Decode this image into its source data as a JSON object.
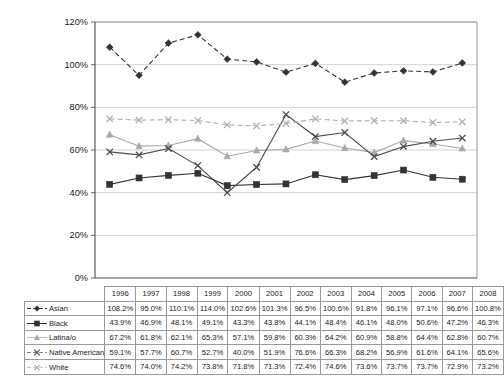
{
  "chart_data": {
    "type": "line",
    "title": "",
    "xlabel": "",
    "ylabel": "",
    "ylim": [
      0,
      120
    ],
    "ytick_labels": [
      "0%",
      "20%",
      "40%",
      "60%",
      "80%",
      "100%",
      "120%"
    ],
    "yticks": [
      0,
      20,
      40,
      60,
      80,
      100,
      120
    ],
    "grid": true,
    "legend_position": "table-left",
    "categories": [
      "1996",
      "1997",
      "1998",
      "1999",
      "2000",
      "2001",
      "2002",
      "2003",
      "2004",
      "2005",
      "2006",
      "2007",
      "2008"
    ],
    "series": [
      {
        "name": "Asian",
        "marker": "diamond",
        "line_style": "dashed",
        "color": "#333333",
        "values": [
          108.2,
          95.0,
          110.1,
          114.0,
          102.6,
          101.3,
          96.5,
          100.6,
          91.8,
          96.1,
          97.1,
          96.6,
          100.8
        ],
        "labels": [
          "108.2%",
          "95.0%",
          "110.1%",
          "114.0%",
          "102.6%",
          "101.3%",
          "96.5%",
          "100.6%",
          "91.8%",
          "96.1%",
          "97.1%",
          "96.6%",
          "100.8%"
        ]
      },
      {
        "name": "Black",
        "marker": "square",
        "line_style": "solid",
        "color": "#333333",
        "values": [
          43.9,
          46.9,
          48.1,
          49.1,
          43.3,
          43.8,
          44.1,
          48.4,
          46.1,
          48.0,
          50.6,
          47.2,
          46.3
        ],
        "labels": [
          "43.9%",
          "46.9%",
          "48.1%",
          "49.1%",
          "43.3%",
          "43.8%",
          "44.1%",
          "48.4%",
          "46.1%",
          "48.0%",
          "50.6%",
          "47.2%",
          "46.3%"
        ]
      },
      {
        "name": "Latina/o",
        "marker": "triangle",
        "line_style": "solid",
        "color": "#a9a9a9",
        "values": [
          67.2,
          61.8,
          62.1,
          65.3,
          57.1,
          59.8,
          60.3,
          64.2,
          60.9,
          58.8,
          64.4,
          62.8,
          60.7
        ],
        "labels": [
          "67.2%",
          "61.8%",
          "62.1%",
          "65.3%",
          "57.1%",
          "59.8%",
          "60.3%",
          "64.2%",
          "60.9%",
          "58.8%",
          "64.4%",
          "62.8%",
          "60.7%"
        ]
      },
      {
        "name": "Native American",
        "marker": "x-cross",
        "line_style": "solid",
        "color": "#4d4d4d",
        "values": [
          59.1,
          57.7,
          60.7,
          52.7,
          40.0,
          51.9,
          76.6,
          66.3,
          68.2,
          56.9,
          61.6,
          64.1,
          65.6
        ],
        "labels": [
          "59.1%",
          "57.7%",
          "60.7%",
          "52.7%",
          "40.0%",
          "51.9%",
          "76.6%",
          "66.3%",
          "68.2%",
          "56.9%",
          "61.6%",
          "64.1%",
          "65.6%"
        ]
      },
      {
        "name": "White",
        "marker": "x-cross",
        "line_style": "dashed",
        "color": "#b0b0b0",
        "values": [
          74.6,
          74.0,
          74.2,
          73.8,
          71.8,
          71.3,
          72.4,
          74.6,
          73.6,
          73.7,
          73.7,
          72.9,
          73.2
        ],
        "labels": [
          "74.6%",
          "74.0%",
          "74.2%",
          "73.8%",
          "71.8%",
          "71.3%",
          "72.4%",
          "74.6%",
          "73.6%",
          "73.7%",
          "73.7%",
          "72.9%",
          "73.2%"
        ]
      }
    ]
  },
  "table": {
    "corner_label": "",
    "year_headers": [
      "1996",
      "1997",
      "1998",
      "1999",
      "2000",
      "2001",
      "2002",
      "2003",
      "2004",
      "2005",
      "2006",
      "2007",
      "2008"
    ],
    "rows": [
      {
        "label": "Asian",
        "values": [
          "108.2%",
          "95.0%",
          "110.1%",
          "114.0%",
          "102.6%",
          "101.3%",
          "96.5%",
          "100.6%",
          "91.8%",
          "96.1%",
          "97.1%",
          "96.6%",
          "100.8%"
        ]
      },
      {
        "label": "Black",
        "values": [
          "43.9%",
          "46.9%",
          "48.1%",
          "49.1%",
          "43.3%",
          "43.8%",
          "44.1%",
          "48.4%",
          "46.1%",
          "48.0%",
          "50.6%",
          "47.2%",
          "46.3%"
        ]
      },
      {
        "label": "Latina/o",
        "values": [
          "67.2%",
          "61.8%",
          "62.1%",
          "65.3%",
          "57.1%",
          "59.8%",
          "60.3%",
          "64.2%",
          "60.9%",
          "58.8%",
          "64.4%",
          "62.8%",
          "60.7%"
        ]
      },
      {
        "label": "Native American",
        "values": [
          "59.1%",
          "57.7%",
          "60.7%",
          "52.7%",
          "40.0%",
          "51.9%",
          "76.6%",
          "66.3%",
          "68.2%",
          "56.9%",
          "61.6%",
          "64.1%",
          "65.6%"
        ]
      },
      {
        "label": "White",
        "values": [
          "74.6%",
          "74.0%",
          "74.2%",
          "73.8%",
          "71.8%",
          "71.3%",
          "72.4%",
          "74.6%",
          "73.6%",
          "73.7%",
          "73.7%",
          "72.9%",
          "73.2%"
        ]
      }
    ]
  },
  "colors": {
    "gridline": "#c8c8c8",
    "axis": "#595959",
    "table_border": "#9a9a9a",
    "text": "#1a1a1a"
  }
}
